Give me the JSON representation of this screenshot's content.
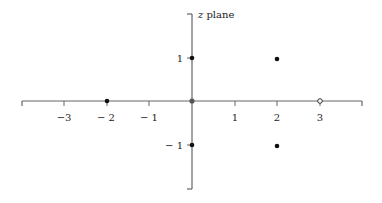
{
  "diagram": {
    "title": "z plane",
    "title_italic": "z",
    "title_rest": " plane",
    "origin_px": [
      192,
      101
    ],
    "unit_px": 42.7,
    "x_axis": {
      "range": [
        -4,
        4
      ],
      "ticks": [
        -3,
        -2,
        -1,
        1,
        2,
        3
      ],
      "tick_labels": [
        "−3",
        "− 2",
        "− 1",
        "1",
        "2",
        "3"
      ]
    },
    "y_axis": {
      "range": [
        -2,
        2
      ],
      "ticks": [
        1,
        -1
      ],
      "tick_labels": [
        "1",
        "− 1"
      ]
    },
    "points": [
      {
        "x": -2,
        "y": 0,
        "style": "filled"
      },
      {
        "x": 0,
        "y": 0,
        "style": "filled-gray"
      },
      {
        "x": 0,
        "y": 1,
        "style": "filled"
      },
      {
        "x": 0,
        "y": -1,
        "style": "filled"
      },
      {
        "x": 2,
        "y": 1,
        "style": "filled"
      },
      {
        "x": 2,
        "y": -1,
        "style": "filled"
      },
      {
        "x": 3,
        "y": 0,
        "style": "open"
      }
    ],
    "colors": {
      "axis": "#666666",
      "point": "#111111",
      "origin_point": "#555555",
      "text": "#1a1a1a"
    }
  }
}
